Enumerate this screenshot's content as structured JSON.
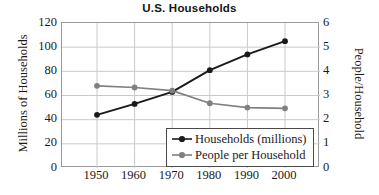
{
  "chart_data": {
    "type": "line",
    "title": "U.S. Households",
    "xlabel": "",
    "ylabel": "Millions of Households",
    "y2label": "People/Household",
    "x": [
      1950,
      1960,
      1970,
      1980,
      1990,
      2000
    ],
    "xticklabels": [
      "1950",
      "1960",
      "1970",
      "1980",
      "1990",
      "2000"
    ],
    "ylim": [
      0,
      120
    ],
    "yticks": [
      0,
      20,
      40,
      60,
      80,
      100,
      120
    ],
    "yticklabels": [
      "0",
      "20",
      "40",
      "60",
      "80",
      "100",
      "120"
    ],
    "y2lim": [
      0,
      6
    ],
    "y2ticks": [
      0,
      1,
      2,
      3,
      4,
      5,
      6
    ],
    "y2ticklabels": [
      "0",
      "1",
      "2",
      "3",
      "4",
      "5",
      "6"
    ],
    "grid": true,
    "legend_position": "lower right",
    "series": [
      {
        "name": "Households (millions)",
        "axis": "left",
        "color": "#1a1a1a",
        "marker": "circle",
        "values": [
          44,
          53,
          63,
          81,
          94,
          105
        ]
      },
      {
        "name": "People per Household",
        "axis": "right",
        "color": "#808080",
        "marker": "circle",
        "values": [
          3.4,
          3.33,
          3.2,
          2.68,
          2.5,
          2.47
        ]
      }
    ]
  },
  "legend": {
    "items": [
      {
        "label": "Households (millions)"
      },
      {
        "label": "People per Household"
      }
    ]
  }
}
